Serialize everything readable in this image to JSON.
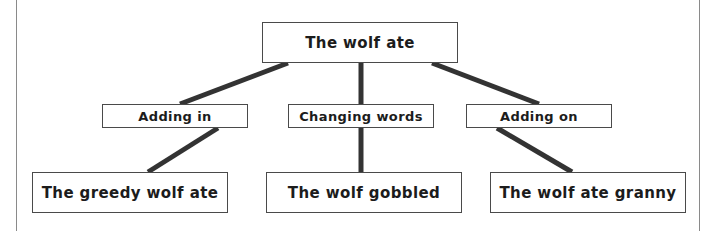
{
  "diagram": {
    "type": "tree",
    "orientation": "top-down",
    "levels": 3,
    "colors": {
      "box_border": "#4a4a4a",
      "connector": "#333333",
      "text": "#1c1c1c",
      "background": "#ffffff",
      "margin_rule": "#8a8a8a"
    },
    "root": {
      "id": "root",
      "label": "The wolf ate"
    },
    "branches": [
      {
        "id": "adding-in",
        "label": "Adding in",
        "child": {
          "id": "greedy-wolf",
          "label": "The greedy wolf ate"
        }
      },
      {
        "id": "changing-words",
        "label": "Changing words",
        "child": {
          "id": "wolf-gobbled",
          "label": "The wolf gobbled"
        }
      },
      {
        "id": "adding-on",
        "label": "Adding on",
        "child": {
          "id": "wolf-granny",
          "label": "The wolf ate granny"
        }
      }
    ]
  }
}
